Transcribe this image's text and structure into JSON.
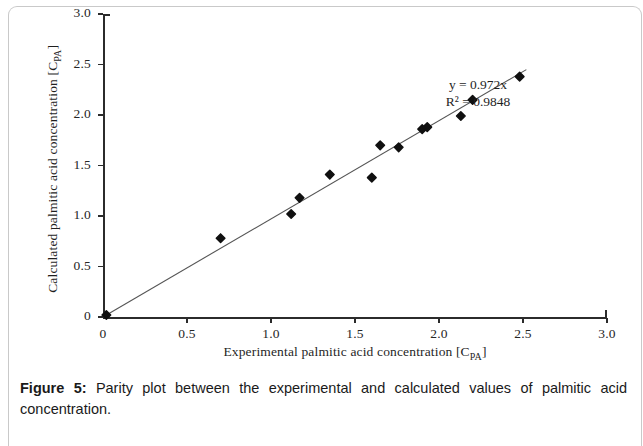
{
  "figure": {
    "caption_label": "Figure 5:",
    "caption_text": " Parity plot between the experimental and calculated values of palmitic acid concentration."
  },
  "annotation": {
    "equation": "y = 0.972x",
    "r_squared": "R² = 0.9848"
  },
  "axes": {
    "x_title_main": "Experimental palmitic acid concentration [C",
    "x_title_sub": "PA",
    "x_title_end": "]",
    "y_title_main": "Calculated palmitic acid concentration [C",
    "y_title_sub": "PA",
    "y_title_end": "]"
  },
  "colors": {
    "marker": "#101010",
    "trendline": "#555555",
    "axis": "#2b2b2b",
    "text": "#1f1f1f",
    "background": "#ffffff"
  },
  "chart_data": {
    "type": "scatter",
    "title": "",
    "xlabel": "Experimental palmitic acid concentration [C_PA]",
    "ylabel": "Calculated palmitic acid concentration [C_PA]",
    "xlim": [
      0,
      3.0
    ],
    "ylim": [
      0,
      3.0
    ],
    "xticks": [
      0,
      0.5,
      1.0,
      1.5,
      2.0,
      2.5,
      3.0
    ],
    "yticks": [
      0,
      0.5,
      1.0,
      1.5,
      2.0,
      2.5,
      3.0
    ],
    "xticklabels": [
      "0",
      "0.5",
      "1.0",
      "1.5",
      "2.0",
      "2.5",
      "3.0"
    ],
    "yticklabels": [
      "0",
      "0.5",
      "1.0",
      "1.5",
      "2.0",
      "2.5",
      "3.0"
    ],
    "grid": false,
    "legend": null,
    "annotations": [
      "y = 0.972x",
      "R² = 0.9848"
    ],
    "series": [
      {
        "name": "palmitic acid parity points",
        "marker": "diamond",
        "color": "#101010",
        "points": [
          {
            "x": 0.02,
            "y": 0.02
          },
          {
            "x": 0.7,
            "y": 0.78
          },
          {
            "x": 1.12,
            "y": 1.02
          },
          {
            "x": 1.17,
            "y": 1.18
          },
          {
            "x": 1.35,
            "y": 1.41
          },
          {
            "x": 1.6,
            "y": 1.38
          },
          {
            "x": 1.65,
            "y": 1.7
          },
          {
            "x": 1.76,
            "y": 1.68
          },
          {
            "x": 1.9,
            "y": 1.86
          },
          {
            "x": 1.93,
            "y": 1.88
          },
          {
            "x": 2.13,
            "y": 1.99
          },
          {
            "x": 2.2,
            "y": 2.15
          },
          {
            "x": 2.48,
            "y": 2.38
          }
        ]
      }
    ],
    "trendline": {
      "type": "linear-through-origin",
      "slope": 0.972,
      "intercept": 0,
      "r_squared": 0.9848,
      "x_start": 0.0,
      "x_end": 2.52,
      "color": "#555555"
    }
  }
}
